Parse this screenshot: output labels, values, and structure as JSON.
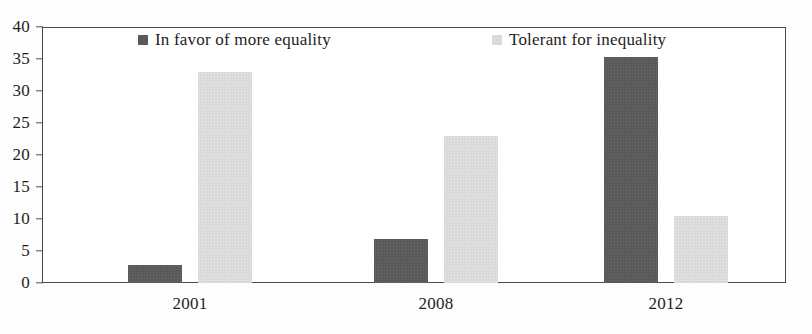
{
  "chart_data": {
    "type": "bar",
    "title": "",
    "subtitle": "",
    "xlabel": "",
    "ylabel": "",
    "categories": [
      "2001",
      "2008",
      "2012"
    ],
    "series": [
      {
        "name": "In favor of more equality",
        "color": "#5a5a5a",
        "values": [
          2.8,
          6.8,
          35.3
        ]
      },
      {
        "name": "Tolerant for inequality",
        "color": "#dadada",
        "values": [
          33.0,
          23.0,
          10.4
        ]
      }
    ],
    "ylim": [
      0,
      40
    ],
    "y_ticks": [
      0,
      5,
      10,
      15,
      20,
      25,
      30,
      35,
      40
    ],
    "y_tick_labels": [
      "0",
      "5",
      "10",
      "15",
      "20",
      "25",
      "30",
      "35",
      "40"
    ],
    "grid": false,
    "legend_position": "top-inside",
    "axis_color": "#4a4a4a",
    "frame": true
  },
  "legend": {
    "entries": [
      {
        "label": "In favor of more equality",
        "swatch": "dark",
        "swatch_name": "legend-swatch-in-favor-of-more-equality"
      },
      {
        "label": "Tolerant for inequality",
        "swatch": "light",
        "swatch_name": "legend-swatch-tolerant-for-inequality"
      }
    ]
  }
}
